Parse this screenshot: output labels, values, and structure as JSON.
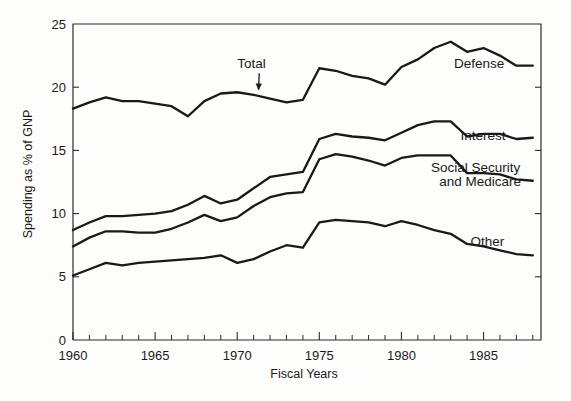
{
  "chart_data": {
    "type": "line",
    "title": "",
    "subtitle": "",
    "xlabel": "Fiscal Years",
    "ylabel": "Spending as % of GNP",
    "xlim": [
      1960,
      1988.5
    ],
    "ylim": [
      0,
      25
    ],
    "grid": false,
    "legend_position": "inline-annotations",
    "stacked": true,
    "note": "Cumulative stacked bands; plotted curves are running totals. Component values given per series.",
    "x": [
      1960,
      1961,
      1962,
      1963,
      1964,
      1965,
      1966,
      1967,
      1968,
      1969,
      1970,
      1971,
      1972,
      1973,
      1974,
      1975,
      1976,
      1977,
      1978,
      1979,
      1980,
      1981,
      1982,
      1983,
      1984,
      1985,
      1986,
      1987,
      1988
    ],
    "xticks": [
      1960,
      1965,
      1970,
      1975,
      1980,
      1985
    ],
    "xtick_labels": [
      "1960",
      "1965",
      "1970",
      "1975",
      "1980",
      "1985"
    ],
    "xminor_ticks_every": 1,
    "yticks": [
      0,
      5,
      10,
      15,
      20,
      25
    ],
    "ytick_labels": [
      "0",
      "5",
      "10",
      "15",
      "20",
      "25"
    ],
    "series": [
      {
        "name": "Other",
        "label": "Other",
        "cumulative_values": [
          5.1,
          5.6,
          6.1,
          5.9,
          6.1,
          6.2,
          6.3,
          6.4,
          6.5,
          6.7,
          6.1,
          6.4,
          7.0,
          7.5,
          7.3,
          9.3,
          9.5,
          9.4,
          9.3,
          9.0,
          9.4,
          9.1,
          8.7,
          8.4,
          7.6,
          7.4,
          7.1,
          6.8,
          6.7
        ],
        "values": [
          5.1,
          5.6,
          6.1,
          5.9,
          6.1,
          6.2,
          6.3,
          6.4,
          6.5,
          6.7,
          6.1,
          6.4,
          7.0,
          7.5,
          7.3,
          9.3,
          9.5,
          9.4,
          9.3,
          9.0,
          9.4,
          9.1,
          8.7,
          8.4,
          7.6,
          7.4,
          7.1,
          6.8,
          6.7
        ]
      },
      {
        "name": "Social Security and Medicare",
        "label": "Social Security\nand Medicare",
        "label_line1": "Social Security",
        "label_line2": "and Medicare",
        "cumulative_values": [
          7.4,
          8.1,
          8.6,
          8.6,
          8.5,
          8.5,
          8.8,
          9.3,
          9.9,
          9.4,
          9.7,
          10.6,
          11.3,
          11.6,
          11.7,
          14.3,
          14.7,
          14.5,
          14.2,
          13.8,
          14.4,
          14.6,
          14.6,
          14.6,
          13.2,
          13.2,
          13.1,
          12.7,
          12.6
        ],
        "values": [
          2.3,
          2.5,
          2.5,
          2.7,
          2.4,
          2.3,
          2.5,
          2.9,
          3.4,
          2.7,
          3.6,
          4.2,
          4.3,
          4.1,
          4.4,
          5.0,
          5.2,
          5.1,
          4.9,
          4.8,
          5.0,
          5.5,
          5.9,
          6.2,
          5.6,
          5.8,
          6.0,
          5.9,
          5.9
        ]
      },
      {
        "name": "Interest",
        "label": "Interest",
        "cumulative_values": [
          8.7,
          9.3,
          9.8,
          9.8,
          9.9,
          10.0,
          10.2,
          10.7,
          11.4,
          10.8,
          11.1,
          12.0,
          12.9,
          13.1,
          13.3,
          15.9,
          16.3,
          16.1,
          16.0,
          15.8,
          16.4,
          17.0,
          17.3,
          17.3,
          16.1,
          16.3,
          16.3,
          15.9,
          16.0
        ],
        "values": [
          1.3,
          1.2,
          1.2,
          1.2,
          1.4,
          1.5,
          1.4,
          1.4,
          1.5,
          1.4,
          1.4,
          1.4,
          1.6,
          1.5,
          1.6,
          1.6,
          1.6,
          1.6,
          1.8,
          2.0,
          2.0,
          2.4,
          2.7,
          2.7,
          2.9,
          3.1,
          3.2,
          3.2,
          3.4
        ]
      },
      {
        "name": "Defense",
        "label": "Defense",
        "cumulative_values": [
          18.3,
          18.8,
          19.2,
          18.9,
          18.9,
          18.7,
          18.5,
          17.7,
          18.9,
          19.5,
          19.6,
          19.4,
          19.1,
          18.8,
          19.0,
          21.5,
          21.3,
          20.9,
          20.7,
          20.2,
          21.6,
          22.2,
          23.1,
          23.6,
          22.8,
          23.1,
          22.5,
          21.7,
          21.7
        ],
        "values": [
          9.6,
          9.5,
          9.4,
          9.1,
          9.0,
          8.7,
          8.3,
          7.0,
          7.5,
          8.7,
          8.5,
          7.4,
          6.2,
          5.7,
          5.7,
          5.6,
          5.0,
          4.8,
          4.7,
          4.4,
          5.2,
          5.2,
          5.8,
          6.3,
          6.7,
          6.8,
          6.2,
          5.8,
          5.7
        ]
      }
    ],
    "annotations": [
      {
        "text": "Total",
        "x": 1970.0,
        "y": 21.5,
        "arrow_to_x": 1971.3,
        "arrow_to_y": 19.8
      },
      {
        "text": "Defense",
        "x": 1983.2,
        "y": 21.5
      },
      {
        "text": "Interest",
        "x": 1983.6,
        "y": 15.8
      },
      {
        "text": "Social Security",
        "x": 1981.8,
        "y": 13.3
      },
      {
        "text": "and Medicare",
        "x": 1982.3,
        "y": 12.2
      },
      {
        "text": "Other",
        "x": 1984.2,
        "y": 7.4
      }
    ],
    "colors": {
      "line": "#191919",
      "axis": "#2b2b2b",
      "text": "#1a1a1a",
      "background": "#fdfdfb"
    }
  }
}
